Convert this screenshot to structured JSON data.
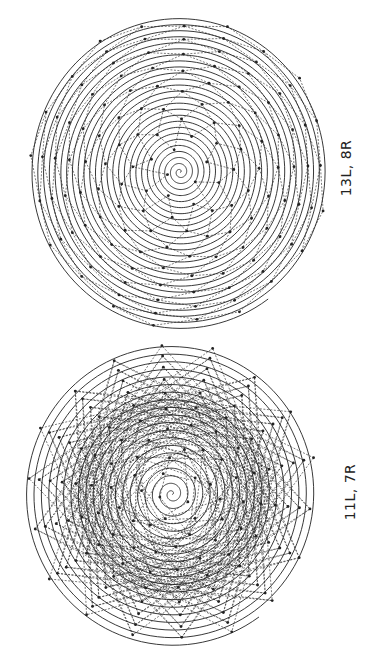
{
  "figure": {
    "panels": [
      {
        "id": "top",
        "label": "13L, 8R",
        "parastichies_left": 13,
        "parastichies_right": 8,
        "center": [
          180,
          172
        ],
        "radius_x": 150,
        "radius_y": 157,
        "turns": 26,
        "stroke": "#222222"
      },
      {
        "id": "bottom",
        "label": "11L, 7R",
        "parastichies_left": 11,
        "parastichies_right": 7,
        "center": [
          172,
          494
        ],
        "radius_x": 148,
        "radius_y": 152,
        "turns": 20,
        "stroke": "#222222"
      }
    ]
  }
}
